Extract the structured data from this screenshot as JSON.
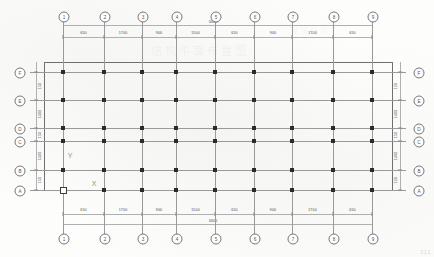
{
  "sheet": {
    "title_watermark": "结构平面布置图",
    "subtitle_watermark": "建筑结构",
    "corner_mark": "311"
  },
  "axes": {
    "x_label": "X",
    "y_label": "Y",
    "origin_name": "origin-marker"
  },
  "overall": {
    "top_total": "3400",
    "bottom_total": "3400"
  },
  "grid": {
    "horizontal_bubbles_top": [
      "1",
      "2",
      "3",
      "4",
      "5",
      "6",
      "7",
      "8",
      "9"
    ],
    "horizontal_bubbles_bottom": [
      "1",
      "2",
      "3",
      "4",
      "5",
      "6",
      "7",
      "8",
      "9"
    ],
    "vertical_bubbles_left": [
      "F",
      "E",
      "D",
      "C",
      "B",
      "A"
    ],
    "vertical_bubbles_right": [
      "F",
      "E",
      "D",
      "C",
      "B",
      "A"
    ]
  },
  "dimensions": {
    "top_chain": [
      "650",
      "1700",
      "900",
      "1500",
      "650",
      "900",
      "1700",
      "650"
    ],
    "bottom_chain": [
      "650",
      "1700",
      "900",
      "1500",
      "650",
      "900",
      "1700",
      "650"
    ],
    "left_chain": [
      "150",
      "1400",
      "150",
      "1400",
      "150"
    ],
    "right_chain": [
      "150",
      "1400",
      "150",
      "1400",
      "150"
    ]
  },
  "chart_data": {
    "type": "table",
    "xlabel": "Grid lines 1-9",
    "ylabel": "Grid lines A-F",
    "grid_x_positions": [
      63,
      104,
      142,
      176,
      215,
      254,
      292,
      333,
      372
    ],
    "grid_y_positions": [
      72,
      100,
      128,
      141,
      170,
      190
    ],
    "column_count": 54
  }
}
